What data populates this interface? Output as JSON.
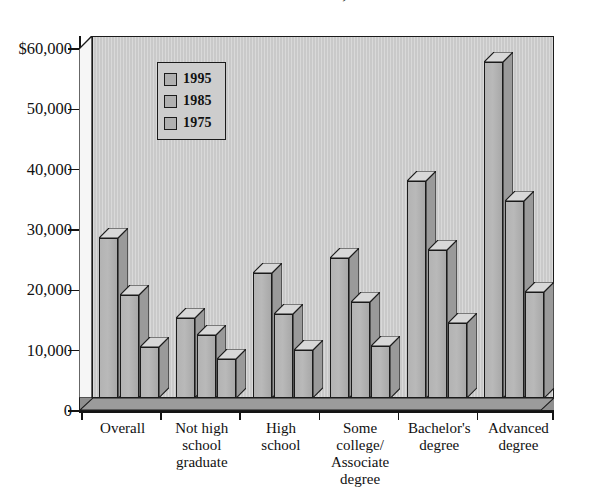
{
  "chart_data": {
    "type": "bar",
    "title": "Educational Attainment, 1975-1995",
    "xlabel": "",
    "ylabel": "",
    "ylim": [
      0,
      60000
    ],
    "yticks": [
      0,
      10000,
      20000,
      30000,
      40000,
      50000,
      60000
    ],
    "ytick_labels": [
      "0",
      "10,000",
      "20,000",
      "30,000",
      "40,000",
      "50,000",
      "$60,000"
    ],
    "grid": false,
    "legend_position": "upper-left-inside",
    "categories": [
      "Overall",
      "Not high school graduate",
      "High school",
      "Some college/ Associate degree",
      "Bachelor's degree",
      "Advanced degree"
    ],
    "category_lines": [
      [
        "Overall"
      ],
      [
        "Not high",
        "school",
        "graduate"
      ],
      [
        "High",
        "school"
      ],
      [
        "Some",
        "college/",
        "Associate",
        "degree"
      ],
      [
        "Bachelor's",
        "degree"
      ],
      [
        "Advanced",
        "degree"
      ]
    ],
    "series": [
      {
        "name": "1995",
        "color": "#b0b0b0",
        "values": [
          26600,
          13200,
          20700,
          23200,
          36000,
          55700
        ]
      },
      {
        "name": "1985",
        "color": "#b0b0b0",
        "values": [
          17000,
          10400,
          14000,
          15900,
          24600,
          32600
        ]
      },
      {
        "name": "1975",
        "color": "#b0b0b0",
        "values": [
          8400,
          6500,
          7900,
          8700,
          12400,
          17600
        ]
      }
    ]
  },
  "legend": {
    "entries": [
      {
        "label": "1995"
      },
      {
        "label": "1985"
      },
      {
        "label": "1975"
      }
    ]
  },
  "colors": {
    "bar_face": "#b3b3b3",
    "bar_side": "#8d8d8d",
    "bar_top": "#dcdcdc",
    "plot_background": "#c9c9c9",
    "floor": "#8f8f8f",
    "axis": "#141414",
    "text": "#111111"
  }
}
